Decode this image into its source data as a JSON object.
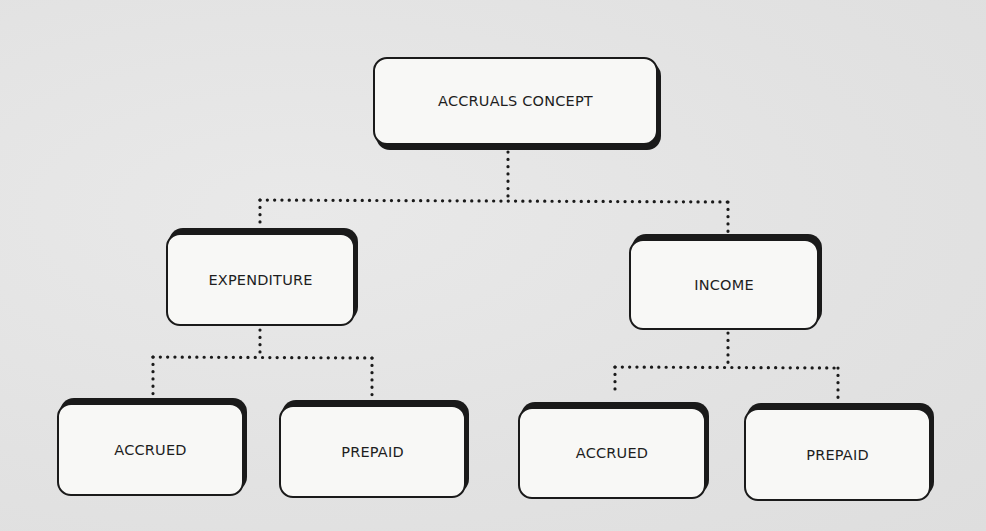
{
  "diagram": {
    "type": "hierarchy-tree",
    "root": {
      "id": "accruals-concept",
      "label": "ACCRUALS CONCEPT",
      "children": [
        {
          "id": "expenditure",
          "label": "EXPENDITURE",
          "children": [
            {
              "id": "expenditure-accrued",
              "label": "ACCRUED"
            },
            {
              "id": "expenditure-prepaid",
              "label": "PREPAID"
            }
          ]
        },
        {
          "id": "income",
          "label": "INCOME",
          "children": [
            {
              "id": "income-accrued",
              "label": "ACCRUED"
            },
            {
              "id": "income-prepaid",
              "label": "PREPAID"
            }
          ]
        }
      ]
    },
    "edges": [
      {
        "from": "accruals-concept",
        "to": "expenditure",
        "style": "dotted"
      },
      {
        "from": "accruals-concept",
        "to": "income",
        "style": "dotted"
      },
      {
        "from": "expenditure",
        "to": "expenditure-accrued",
        "style": "dotted"
      },
      {
        "from": "expenditure",
        "to": "expenditure-prepaid",
        "style": "dotted"
      },
      {
        "from": "income",
        "to": "income-accrued",
        "style": "dotted"
      },
      {
        "from": "income",
        "to": "income-prepaid",
        "style": "dotted"
      }
    ],
    "colors": {
      "background": "#e4e4e4",
      "node_fill": "#f8f8f6",
      "node_border": "#1a1a1a",
      "connector": "#1a1a1a",
      "text": "#1e1e1e"
    }
  },
  "nodes": {
    "root": "ACCRUALS CONCEPT",
    "expenditure": "EXPENDITURE",
    "income": "INCOME",
    "expenditure_accrued": "ACCRUED",
    "expenditure_prepaid": "PREPAID",
    "income_accrued": "ACCRUED",
    "income_prepaid": "PREPAID"
  }
}
